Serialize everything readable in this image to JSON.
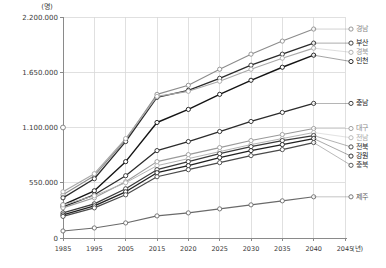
{
  "chart_data": {
    "type": "line",
    "title": "",
    "xlabel": "년",
    "ylabel": "명",
    "y_unit_label": "(명)",
    "x_unit_label": "(년)",
    "grid": true,
    "legend_position": "right",
    "xlim": [
      1985,
      2045
    ],
    "ylim": [
      0,
      2200000
    ],
    "x": [
      1985,
      1995,
      2005,
      2015,
      2020,
      2025,
      2030,
      2035,
      2040
    ],
    "x_tick_labels": [
      "1985",
      "1995",
      "2005",
      "2015",
      "2020",
      "2025",
      "2030",
      "2035",
      "2040",
      "2045"
    ],
    "x_ticks": [
      1985,
      1995,
      2005,
      2015,
      2020,
      2025,
      2030,
      2035,
      2040,
      2045
    ],
    "y_ticks": [
      0,
      550000,
      1100000,
      1650000,
      2200000
    ],
    "y_tick_labels": [
      "0",
      "550.000",
      "1.100.000",
      "1.650.000",
      "2.200.000"
    ],
    "series": [
      {
        "name": "경남",
        "color": "#8c8c8c",
        "width": 1.1,
        "label_color": "#8a8a8a",
        "values": [
          430000,
          620000,
          980000,
          1430000,
          1520000,
          1680000,
          1830000,
          1960000,
          2080000
        ]
      },
      {
        "name": "부산",
        "color": "#2b2b2b",
        "width": 1.3,
        "label_color": "#1a1a1a",
        "values": [
          400000,
          590000,
          960000,
          1400000,
          1470000,
          1590000,
          1720000,
          1830000,
          1940000
        ]
      },
      {
        "name": "경북",
        "color": "#a8a8a8",
        "width": 1.1,
        "label_color": "#9a9a9a",
        "values": [
          460000,
          640000,
          990000,
          1410000,
          1460000,
          1560000,
          1680000,
          1790000,
          1890000
        ]
      },
      {
        "name": "인천",
        "color": "#141414",
        "width": 1.4,
        "label_color": "#0d0d0d",
        "values": [
          330000,
          470000,
          760000,
          1150000,
          1280000,
          1430000,
          1570000,
          1700000,
          1820000
        ]
      },
      {
        "name": "충남",
        "color": "#2b2b2b",
        "width": 1.3,
        "label_color": "#1a1a1a",
        "values": [
          310000,
          430000,
          620000,
          870000,
          960000,
          1060000,
          1160000,
          1250000,
          1340000
        ]
      },
      {
        "name": "대구",
        "color": "#9a9a9a",
        "width": 1.1,
        "label_color": "#8a8a8a",
        "values": [
          300000,
          400000,
          560000,
          760000,
          830000,
          900000,
          970000,
          1030000,
          1090000
        ]
      },
      {
        "name": "전남",
        "color": "#b4b4b4",
        "width": 1.0,
        "label_color": "#a8a8a8",
        "values": [
          330000,
          420000,
          550000,
          720000,
          790000,
          860000,
          930000,
          990000,
          1050000
        ]
      },
      {
        "name": "전북",
        "color": "#3a3a3a",
        "width": 1.2,
        "label_color": "#2b2b2b",
        "values": [
          250000,
          340000,
          490000,
          680000,
          760000,
          840000,
          910000,
          970000,
          1020000
        ]
      },
      {
        "name": "강원",
        "color": "#1f1f1f",
        "width": 1.3,
        "label_color": "#141414",
        "values": [
          230000,
          320000,
          460000,
          650000,
          720000,
          800000,
          870000,
          930000,
          990000
        ]
      },
      {
        "name": "충북",
        "color": "#4a4a4a",
        "width": 1.2,
        "label_color": "#3a3a3a",
        "values": [
          215000,
          300000,
          430000,
          610000,
          680000,
          750000,
          820000,
          880000,
          950000
        ]
      },
      {
        "name": "제주",
        "color": "#6a6a6a",
        "width": 1.1,
        "label_color": "#5a5a5a",
        "values": [
          70000,
          100000,
          150000,
          220000,
          250000,
          290000,
          330000,
          370000,
          410000
        ]
      }
    ],
    "isolated_point": {
      "x": 1985,
      "y": 1100000,
      "note": "단독 표식"
    }
  }
}
